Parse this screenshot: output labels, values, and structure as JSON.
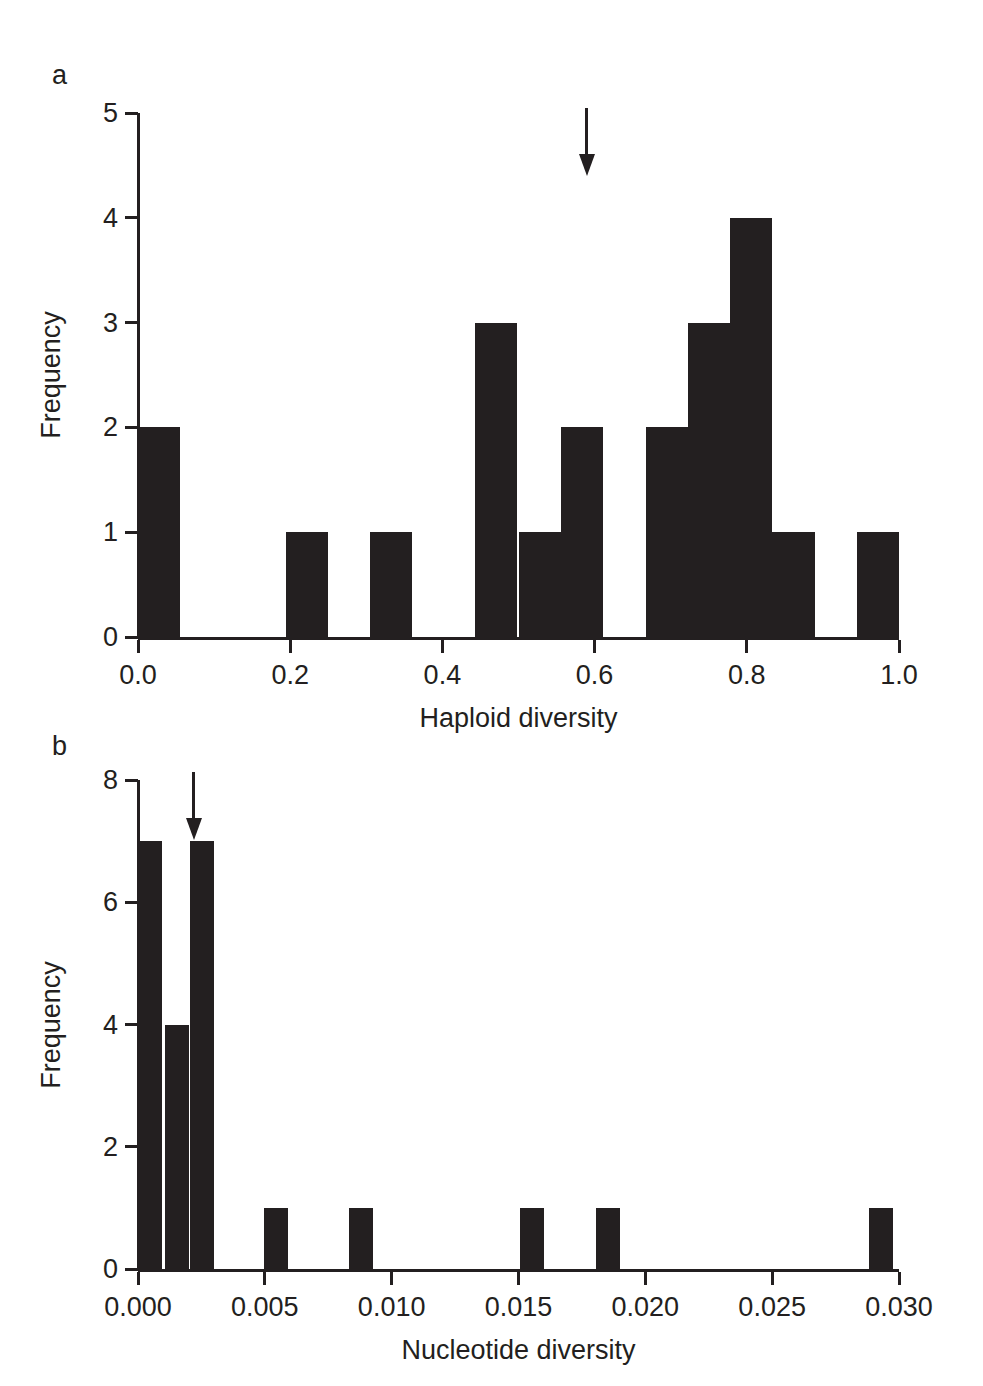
{
  "figure": {
    "panels": [
      {
        "label": "a",
        "arrow_label": "mean-indicator-arrow"
      },
      {
        "label": "b",
        "arrow_label": "mean-indicator-arrow"
      }
    ]
  },
  "chart_data": [
    {
      "type": "bar",
      "panel": "a",
      "title": "",
      "xlabel": "Haploid diversity",
      "ylabel": "Frequency",
      "xlim": [
        0.0,
        1.0
      ],
      "ylim": [
        0,
        5
      ],
      "xticks": [
        "0.0",
        "0.2",
        "0.4",
        "0.6",
        "0.8",
        "1.0"
      ],
      "xtick_values": [
        0.0,
        0.2,
        0.4,
        0.6,
        0.8,
        1.0
      ],
      "yticks": [
        "0",
        "1",
        "2",
        "3",
        "4",
        "5"
      ],
      "ytick_values": [
        0,
        1,
        2,
        3,
        4,
        5
      ],
      "grid": false,
      "legend": "none",
      "bin_width": 0.0555,
      "bins": [
        {
          "left": 0.0,
          "value": 2
        },
        {
          "left": 0.1945,
          "value": 1
        },
        {
          "left": 0.3045,
          "value": 1
        },
        {
          "left": 0.4425,
          "value": 3
        },
        {
          "left": 0.5,
          "value": 1
        },
        {
          "left": 0.5555,
          "value": 2
        },
        {
          "left": 0.667,
          "value": 2
        },
        {
          "left": 0.7225,
          "value": 3
        },
        {
          "left": 0.778,
          "value": 4
        },
        {
          "left": 0.8335,
          "value": 1
        },
        {
          "left": 0.9445,
          "value": 1
        },
        {
          "left": 1.055,
          "value": 1
        }
      ],
      "annotations": [
        {
          "kind": "arrow",
          "x": 0.59,
          "points": "down",
          "label": "mean haploid diversity"
        }
      ]
    },
    {
      "type": "bar",
      "panel": "b",
      "title": "",
      "xlabel": "Nucleotide diversity",
      "ylabel": "Frequency",
      "xlim": [
        0.0,
        0.03
      ],
      "ylim": [
        0,
        8
      ],
      "xticks": [
        "0.000",
        "0.005",
        "0.010",
        "0.015",
        "0.020",
        "0.025",
        "0.030"
      ],
      "xtick_values": [
        0.0,
        0.005,
        0.01,
        0.015,
        0.02,
        0.025,
        0.03
      ],
      "yticks": [
        "0",
        "2",
        "4",
        "6",
        "8"
      ],
      "ytick_values": [
        0,
        2,
        4,
        6,
        8
      ],
      "grid": false,
      "legend": "none",
      "bin_width": 0.00095,
      "bins": [
        {
          "left": 0.0,
          "value": 7
        },
        {
          "left": 0.00105,
          "value": 4
        },
        {
          "left": 0.00205,
          "value": 7
        },
        {
          "left": 0.00495,
          "value": 1
        },
        {
          "left": 0.0083,
          "value": 1
        },
        {
          "left": 0.01505,
          "value": 1
        },
        {
          "left": 0.01805,
          "value": 1
        },
        {
          "left": 0.0288,
          "value": 1
        }
      ],
      "annotations": [
        {
          "kind": "arrow",
          "x": 0.0022,
          "points": "down",
          "label": "mean nucleotide diversity"
        }
      ]
    }
  ]
}
